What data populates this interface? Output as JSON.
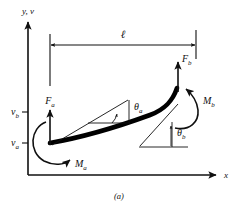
{
  "figure": {
    "caption": "(a)"
  },
  "axes": {
    "y_axis_label": "y, v",
    "x_axis_label": "x",
    "ticks": [
      {
        "name": "v_b",
        "label": "v",
        "sub": "b"
      },
      {
        "name": "v_a",
        "label": "v",
        "sub": "a"
      }
    ]
  },
  "dimension": {
    "name": "beam-length",
    "label": "ℓ"
  },
  "loads": [
    {
      "name": "force-a",
      "label": "F",
      "sub": "a"
    },
    {
      "name": "force-b",
      "label": "F",
      "sub": "b"
    },
    {
      "name": "moment-a",
      "label": "M",
      "sub": "a"
    },
    {
      "name": "moment-b",
      "label": "M",
      "sub": "b"
    }
  ],
  "angles": [
    {
      "name": "theta-a",
      "label": "θ",
      "sub": "a"
    },
    {
      "name": "theta-b",
      "label": "θ",
      "sub": "b"
    }
  ],
  "colors": {
    "ink": "#101010",
    "beam": "#000000",
    "background": "#ffffff"
  }
}
